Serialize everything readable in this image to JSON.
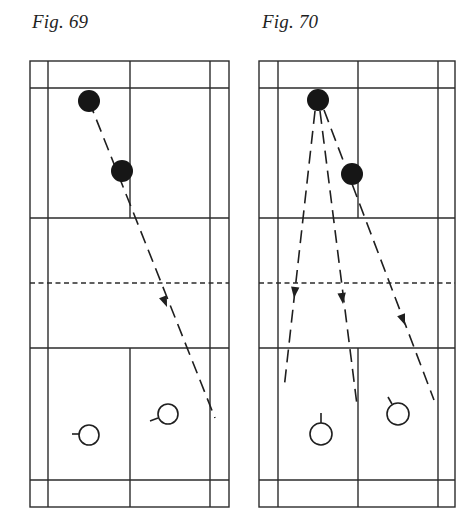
{
  "figures": [
    {
      "id": "fig-69",
      "caption": "Fig. 69",
      "court": {
        "outer": {
          "x1": 30,
          "x2": 229,
          "y1": 61,
          "y2": 507
        },
        "side_inner": {
          "left": 48,
          "right": 210
        },
        "center_x": 130,
        "back_service_top": 88,
        "short_service_top": 218,
        "net_y": 283,
        "short_service_bottom": 348,
        "back_service_bottom": 480
      },
      "filled_players": [
        {
          "cx": 89,
          "cy": 101,
          "r": 11
        },
        {
          "cx": 122,
          "cy": 171,
          "r": 11
        }
      ],
      "open_players": [
        {
          "cx": 89,
          "cy": 435,
          "r": 10,
          "racket": {
            "x1": 72,
            "y1": 434,
            "x2": 79,
            "y2": 434
          }
        },
        {
          "cx": 168,
          "cy": 414,
          "r": 10,
          "racket": {
            "x1": 150,
            "y1": 421,
            "x2": 158,
            "y2": 418
          }
        }
      ],
      "trajectories": [
        {
          "x1": 89,
          "y1": 101,
          "x2": 215,
          "y2": 418,
          "arrow": {
            "x": 167,
            "y": 307
          }
        }
      ]
    },
    {
      "id": "fig-70",
      "caption": "Fig. 70",
      "court": {
        "outer": {
          "x1": 259,
          "x2": 455,
          "y1": 61,
          "y2": 507
        },
        "side_inner": {
          "left": 278,
          "right": 438
        },
        "center_x": 358,
        "back_service_top": 88,
        "short_service_top": 218,
        "net_y": 283,
        "short_service_bottom": 348,
        "back_service_bottom": 480
      },
      "filled_players": [
        {
          "cx": 318,
          "cy": 100,
          "r": 11
        },
        {
          "cx": 352,
          "cy": 174,
          "r": 11
        }
      ],
      "open_players": [
        {
          "cx": 321,
          "cy": 434,
          "r": 11,
          "racket": {
            "x1": 321,
            "y1": 413,
            "x2": 321,
            "y2": 423
          }
        },
        {
          "cx": 398,
          "cy": 414,
          "r": 11,
          "racket": {
            "x1": 388,
            "y1": 397,
            "x2": 392,
            "y2": 404
          }
        }
      ],
      "trajectories": [
        {
          "x1": 315,
          "y1": 111,
          "x2": 284,
          "y2": 389,
          "arrow": {
            "x": 294,
            "y": 298
          }
        },
        {
          "x1": 320,
          "y1": 111,
          "x2": 357,
          "y2": 405,
          "arrow": {
            "x": 343,
            "y": 304
          }
        },
        {
          "x1": 324,
          "y1": 110,
          "x2": 434,
          "y2": 400,
          "arrow": {
            "x": 405,
            "y": 325
          }
        }
      ]
    }
  ]
}
